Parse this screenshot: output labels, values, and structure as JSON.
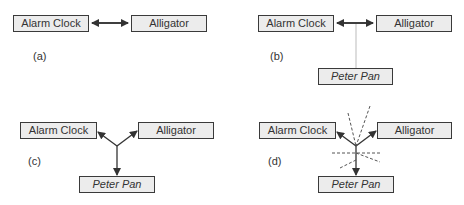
{
  "panels": [
    {
      "id": "a",
      "label": "(a)",
      "nodes": {
        "left": "Alarm Clock",
        "right": "Alligator"
      },
      "connection": "bidirectional arrow between Alarm Clock and Alligator"
    },
    {
      "id": "b",
      "label": "(b)",
      "nodes": {
        "left": "Alarm Clock",
        "right": "Alligator",
        "bottom": "Peter Pan"
      },
      "connection": "bidirectional arrow with faint vertical line down to Peter Pan"
    },
    {
      "id": "c",
      "label": "(c)",
      "nodes": {
        "left": "Alarm Clock",
        "right": "Alligator",
        "bottom": "Peter Pan"
      },
      "connection": "three-way junction with arrows to each node"
    },
    {
      "id": "d",
      "label": "(d)",
      "nodes": {
        "left": "Alarm Clock",
        "right": "Alligator",
        "bottom": "Peter Pan"
      },
      "connection": "three-way junction with arrows and dashed lines"
    }
  ],
  "colors": {
    "box_fill": "#ececec",
    "box_border": "#3a3a3a",
    "arrow": "#333333",
    "dashed": "#555555",
    "faint_line": "#bbbbbb"
  }
}
